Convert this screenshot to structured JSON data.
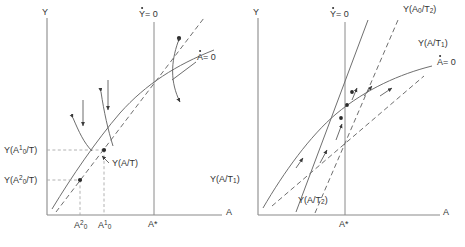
{
  "figure": {
    "type": "phase-diagram",
    "panels": [
      {
        "id": "left",
        "axis_y_label": "Y",
        "axis_x_label": "A",
        "curve_labels": {
          "y_dot_zero": "= 0",
          "y_dot_symbol": "Y",
          "a_dot_zero": "= 0",
          "a_dot_symbol": "A",
          "y_of_a_over_t": "Y(A/T)"
        },
        "y_ticks": [
          {
            "base": "Y(A",
            "sub": "0",
            "sup": "1",
            "tail": "/T)"
          },
          {
            "base": "Y(A",
            "sub": "0",
            "sup": "2",
            "tail": "/T)"
          }
        ],
        "x_ticks": [
          {
            "base": "A",
            "sub": "0",
            "sup": "2"
          },
          {
            "base": "A",
            "sub": "0",
            "sup": "1"
          },
          {
            "base": "A*",
            "sub": "",
            "sup": ""
          }
        ]
      },
      {
        "id": "right",
        "axis_y_label": "Y",
        "axis_x_label": "A",
        "curve_labels": {
          "y_dot_zero": "= 0",
          "y_dot_symbol": "Y",
          "a_dot_zero": "= 0",
          "a_dot_symbol": "A",
          "y_a0_over_t2_base": "Y(A",
          "y_a0_over_t2_sub": "0",
          "y_a0_over_t2_tail": "/T",
          "y_a0_over_t2_sub2": "2",
          "y_a0_over_t2_close": ")",
          "y_a_over_t1_base": "Y(A/T",
          "y_a_over_t1_sub": "1",
          "y_a_over_t1_close": ")",
          "y_a_over_t1_left_base": "Y(A/T",
          "y_a_over_t1_left_sub": "1",
          "y_a_over_t1_left_close": ")",
          "y_a_over_t2_base": "Y(A/T",
          "y_a_over_t2_sub": "2",
          "y_a_over_t2_close": ")"
        },
        "x_ticks": [
          {
            "base": "A*",
            "sub": "",
            "sup": ""
          }
        ]
      }
    ],
    "colors": {
      "axis": "#8a8a8a",
      "curve": "#6f6f6f",
      "guide": "#a9a9a9",
      "text": "#333333",
      "marker": "#2b2b2b",
      "background": "#ffffff"
    }
  }
}
